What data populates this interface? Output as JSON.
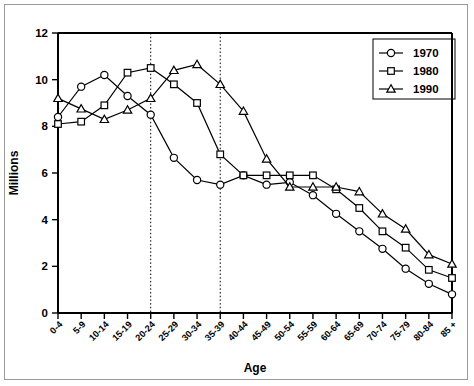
{
  "chart_data": {
    "type": "line",
    "title": "",
    "xlabel": "Age",
    "ylabel": "Millions",
    "ylim": [
      0,
      12
    ],
    "yticks": [
      0,
      2,
      4,
      6,
      8,
      10,
      12
    ],
    "grid": false,
    "legend_position": "top-right",
    "categories": [
      "0-4",
      "5-9",
      "10-14",
      "15-19",
      "20-24",
      "25-29",
      "30-34",
      "35-39",
      "40-44",
      "45-49",
      "50-54",
      "55-59",
      "60-64",
      "65-69",
      "70-74",
      "75-79",
      "80-84",
      "85 +"
    ],
    "annotations": {
      "vertical_reference_lines": [
        "20-24",
        "35-39"
      ],
      "line_style": "dotted"
    },
    "series": [
      {
        "name": "1970",
        "marker": "circle",
        "values": [
          8.4,
          9.7,
          10.2,
          9.3,
          8.5,
          6.65,
          5.7,
          5.5,
          5.9,
          5.5,
          5.6,
          5.05,
          4.25,
          3.5,
          2.75,
          1.9,
          1.25,
          0.8
        ]
      },
      {
        "name": "1980",
        "marker": "square",
        "values": [
          8.1,
          8.2,
          8.9,
          10.3,
          10.5,
          9.8,
          9.0,
          6.8,
          5.9,
          5.9,
          5.9,
          5.9,
          5.3,
          4.5,
          3.5,
          2.8,
          1.85,
          1.5
        ]
      },
      {
        "name": "1990",
        "marker": "triangle",
        "values": [
          9.2,
          8.75,
          8.3,
          8.7,
          9.2,
          10.4,
          10.65,
          9.8,
          8.65,
          6.6,
          5.4,
          5.4,
          5.4,
          5.2,
          4.25,
          3.6,
          2.5,
          2.1
        ]
      }
    ]
  },
  "legend": {
    "entries": [
      {
        "label": "1970"
      },
      {
        "label": "1980"
      },
      {
        "label": "1990"
      }
    ]
  },
  "axes": {
    "y_title": "Millions",
    "x_title": "Age",
    "y_tick_labels": [
      "0",
      "2",
      "4",
      "6",
      "8",
      "10",
      "12"
    ],
    "x_tick_labels": [
      "0-4",
      "5-9",
      "10-14",
      "15-19",
      "20-24",
      "25-29",
      "30-34",
      "35-39",
      "40-44",
      "45-49",
      "50-54",
      "55-59",
      "60-64",
      "65-69",
      "70-74",
      "75-79",
      "80-84",
      "85 +"
    ]
  },
  "colors": {
    "line": "#000000",
    "marker_fill": "#ffffff",
    "frame": "#9a9a9a",
    "background": "#ffffff"
  }
}
